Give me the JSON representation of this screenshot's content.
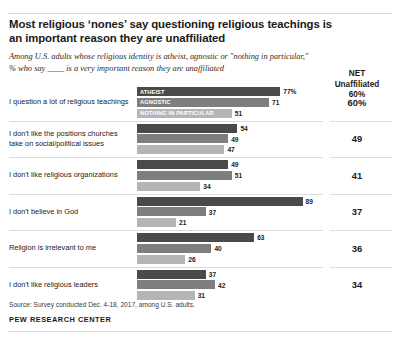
{
  "header": {
    "title": "Most religious ‘nones’ say questioning religious teachings is an important reason they are unaffiliated",
    "subtitle": "Among U.S. adults whose religious identity is atheist, agnostic or \"nothing in particular,\" % who say ____ is a very important reason they are unaffiliated",
    "net_column_header": "NET\nUnaffiliated\n60%",
    "net_header_line1": "NET",
    "net_header_line2": "Unaffiliated",
    "net_header_line3": "60%"
  },
  "footer": {
    "source": "Source: Survey conducted Dec. 4-18, 2017, among U.S. adults.",
    "org": "PEW RESEARCH CENTER"
  },
  "chart_data": {
    "type": "bar",
    "orientation": "horizontal",
    "title": "Most religious ‘nones’ say questioning religious teachings is an important reason they are unaffiliated",
    "subtitle": "Among U.S. adults whose religious identity is atheist, agnostic or \"nothing in particular,\" % who say ____ is a very important reason they are unaffiliated",
    "xlabel": "",
    "ylabel": "",
    "xlim": [
      0,
      100
    ],
    "grid": false,
    "legend_position": "inline-first-group",
    "legend": [
      "ATHEIST",
      "AGNOSTIC",
      "NOTHING IN PARTICULAR"
    ],
    "categories": [
      "I question a lot of religious teachings",
      "I don't like the positions churches take on social/political issues",
      "I don't like religious organizations",
      "I don't believe in God",
      "Religion is irrelevant to me",
      "I don't like religious leaders"
    ],
    "series": [
      {
        "name": "ATHEIST",
        "color": "#4a4a4a",
        "values": [
          77,
          54,
          49,
          89,
          63,
          37
        ],
        "labels": [
          "77%",
          "54",
          "49",
          "89",
          "63",
          "37"
        ]
      },
      {
        "name": "AGNOSTIC",
        "color": "#7e7e7e",
        "values": [
          71,
          49,
          51,
          37,
          40,
          42
        ],
        "labels": [
          "71",
          "49",
          "51",
          "37",
          "40",
          "42"
        ]
      },
      {
        "name": "NOTHING IN PARTICULAR",
        "color": "#b5b5b5",
        "values": [
          51,
          47,
          34,
          21,
          26,
          31
        ],
        "labels": [
          "51",
          "47",
          "34",
          "21",
          "26",
          "31"
        ]
      }
    ],
    "net_unaffiliated": {
      "header": "NET Unaffiliated 60%",
      "values": [
        60,
        49,
        41,
        37,
        36,
        34
      ],
      "labels": [
        "60%",
        "49",
        "41",
        "37",
        "36",
        "34"
      ]
    }
  }
}
